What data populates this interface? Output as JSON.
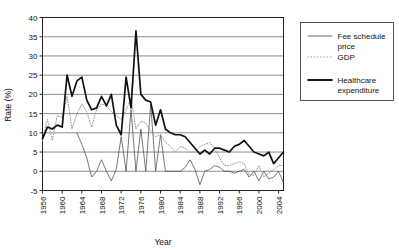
{
  "chart_data": {
    "type": "line",
    "title": "",
    "xlabel": "Year",
    "ylabel": "Rate (%)",
    "xlim": [
      1956,
      2005
    ],
    "ylim": [
      -5,
      40
    ],
    "ytick_step": 5,
    "yticks": [
      -5,
      0,
      5,
      10,
      15,
      20,
      25,
      30,
      35,
      40
    ],
    "xticks": [
      1956,
      1960,
      1964,
      1968,
      1972,
      1976,
      1980,
      1984,
      1988,
      1992,
      1996,
      2000,
      2004
    ],
    "grid": "horizontal",
    "legend_position": "right-outside",
    "series": [
      {
        "name": "Fee schedule price",
        "style": "thin-solid",
        "color": "#4a4a4a",
        "x": [
          1963,
          1964,
          1965,
          1966,
          1967,
          1968,
          1969,
          1970,
          1971,
          1972,
          1973,
          1974,
          1975,
          1976,
          1977,
          1978,
          1979,
          1980,
          1981,
          1982,
          1983,
          1984,
          1985,
          1986,
          1987,
          1988,
          1989,
          1990,
          1991,
          1992,
          1993,
          1994,
          1995,
          1996,
          1997,
          1998,
          1999,
          2000,
          2001,
          2002,
          2003,
          2004,
          2005
        ],
        "values": [
          10.0,
          7.0,
          3.5,
          -1.5,
          0.0,
          3.0,
          0.0,
          -2.5,
          0.5,
          9.0,
          0.0,
          16.0,
          0.0,
          11.0,
          0.0,
          17.5,
          0.0,
          9.5,
          0.0,
          0.0,
          0.0,
          0.0,
          1.0,
          3.0,
          0.5,
          -3.5,
          0.0,
          0.5,
          1.5,
          1.0,
          0.0,
          0.0,
          -0.5,
          0.0,
          0.5,
          -1.5,
          0.0,
          -2.5,
          0.0,
          -2.0,
          -1.5,
          0.0,
          -3.0
        ]
      },
      {
        "name": "GDP",
        "style": "dotted",
        "color": "#9a9a9a",
        "x": [
          1956,
          1957,
          1958,
          1959,
          1960,
          1961,
          1962,
          1963,
          1964,
          1965,
          1966,
          1967,
          1968,
          1969,
          1970,
          1971,
          1972,
          1973,
          1974,
          1975,
          1976,
          1977,
          1978,
          1979,
          1980,
          1981,
          1982,
          1983,
          1984,
          1985,
          1986,
          1987,
          1988,
          1989,
          1990,
          1991,
          1992,
          1993,
          1994,
          1995,
          1996,
          1997,
          1998,
          1999,
          2000,
          2001,
          2002,
          2003,
          2004,
          2005
        ],
        "values": [
          8.0,
          13.5,
          8.0,
          14.5,
          14.0,
          19.5,
          11.0,
          15.0,
          17.5,
          15.5,
          11.5,
          16.0,
          17.5,
          17.0,
          15.5,
          14.5,
          13.5,
          16.0,
          19.0,
          11.0,
          13.0,
          12.5,
          10.5,
          9.0,
          9.5,
          7.5,
          6.5,
          5.0,
          6.5,
          6.0,
          5.0,
          5.0,
          6.5,
          7.0,
          7.5,
          6.0,
          3.5,
          1.5,
          1.5,
          2.0,
          2.5,
          2.0,
          -1.0,
          -1.0,
          1.5,
          -1.5,
          -0.5,
          0.5,
          1.5,
          1.5
        ]
      },
      {
        "name": "Healthcare expenditure",
        "style": "thick-solid",
        "color": "#111111",
        "x": [
          1956,
          1957,
          1958,
          1959,
          1960,
          1961,
          1962,
          1963,
          1964,
          1965,
          1966,
          1967,
          1968,
          1969,
          1970,
          1971,
          1972,
          1973,
          1974,
          1975,
          1976,
          1977,
          1978,
          1979,
          1980,
          1981,
          1982,
          1983,
          1984,
          1985,
          1986,
          1987,
          1988,
          1989,
          1990,
          1991,
          1992,
          1993,
          1994,
          1995,
          1996,
          1997,
          1998,
          1999,
          2000,
          2001,
          2002,
          2003,
          2004,
          2005
        ],
        "values": [
          8.5,
          11.5,
          11.0,
          12.0,
          11.5,
          25.0,
          19.5,
          23.5,
          24.5,
          18.5,
          16.0,
          16.5,
          19.5,
          17.0,
          20.0,
          12.0,
          9.5,
          24.5,
          16.5,
          36.5,
          20.0,
          18.5,
          18.0,
          12.0,
          16.0,
          11.0,
          10.0,
          9.5,
          9.5,
          9.0,
          7.5,
          6.0,
          4.5,
          5.5,
          4.5,
          6.0,
          6.0,
          5.5,
          5.0,
          6.5,
          7.0,
          8.0,
          6.5,
          5.0,
          4.5,
          4.0,
          5.0,
          2.0,
          3.5,
          5.0
        ]
      }
    ]
  },
  "legend": {
    "items": [
      {
        "label_line1": "Fee schedule",
        "label_line2": "price",
        "style": "thin-solid"
      },
      {
        "label_line1": "GDP",
        "label_line2": "",
        "style": "dotted"
      },
      {
        "label_line1": "Healthcare",
        "label_line2": "expenditure",
        "style": "thick-solid"
      }
    ]
  }
}
